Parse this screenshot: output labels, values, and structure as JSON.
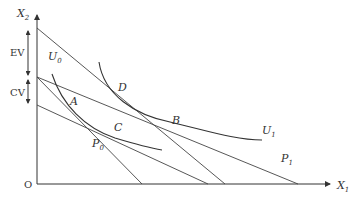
{
  "axes": {
    "y_label": "X",
    "y_label_sub": "2",
    "x_label": "X",
    "x_label_sub": "1",
    "origin_label": "O"
  },
  "measures": {
    "ev_label": "EV",
    "cv_label": "CV"
  },
  "curves": {
    "u0_label": "U",
    "u0_sub": "0",
    "u1_label": "U",
    "u1_sub": "1"
  },
  "budget_lines": {
    "p0_label": "P",
    "p0_sub": "0",
    "p1_label": "P",
    "p1_sub": "1"
  },
  "points": {
    "a": "A",
    "b": "B",
    "c": "C",
    "d": "D"
  },
  "colors": {
    "ink": "#333333",
    "background": "#ffffff"
  }
}
